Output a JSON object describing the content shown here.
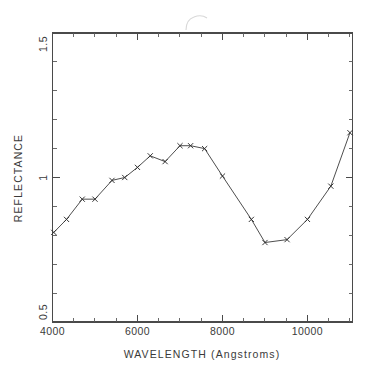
{
  "figure": {
    "background_color": "#ffffff",
    "line_color": "#3a3a3a",
    "axis_color": "#4a4a4a",
    "artifact_label": "scan-artifact"
  },
  "chart_data": {
    "type": "line",
    "title": "",
    "xlabel": "WAVELENGTH (Angstroms)",
    "ylabel": "REFLECTANCE",
    "xlim": [
      4000,
      11060
    ],
    "ylim": [
      0.5,
      1.5
    ],
    "grid": false,
    "legend": null,
    "marker": "x",
    "x_major_ticks": [
      4000,
      6000,
      8000,
      10000
    ],
    "x_major_tick_labels": [
      "4000",
      "6000",
      "8000",
      "10000"
    ],
    "x_minor_tick_step": 500,
    "y_major_ticks": [
      0.5,
      1.0,
      1.5
    ],
    "y_major_tick_labels": [
      "0.5",
      "1",
      "1.5"
    ],
    "y_minor_tick_step": 0.1,
    "series": [
      {
        "name": "reflectance",
        "x": [
          4030,
          4330,
          4700,
          5000,
          5400,
          5700,
          6000,
          6300,
          6650,
          7000,
          7250,
          7580,
          8000,
          8680,
          9000,
          9520,
          10000,
          10550,
          11000
        ],
        "y": [
          0.81,
          0.855,
          0.925,
          0.925,
          0.99,
          1.0,
          1.035,
          1.075,
          1.055,
          1.11,
          1.11,
          1.1,
          1.005,
          0.855,
          0.775,
          0.785,
          0.855,
          0.97,
          1.155
        ]
      }
    ]
  },
  "axes_layout": {
    "plot_left_px": 52.5,
    "plot_right_px": 352.5,
    "plot_top_px": 33.0,
    "plot_bottom_px": 322.0
  }
}
